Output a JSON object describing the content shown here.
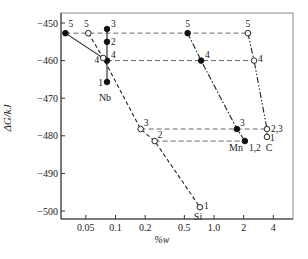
{
  "chart_data": {
    "type": "line",
    "title": "",
    "xlabel": "%w",
    "ylabel": "ΔG/kJ",
    "x_scale": "log",
    "xlim": [
      0.025,
      7.0
    ],
    "ylim": [
      -502,
      -447
    ],
    "x_ticks": [
      0.05,
      0.1,
      0.2,
      0.5,
      1.0,
      2,
      4
    ],
    "x_tick_labels": [
      "0.05",
      "0.1",
      "0.2",
      "0.5",
      "1.0",
      "2",
      "4"
    ],
    "y_ticks": [
      -450,
      -460,
      -470,
      -480,
      -490,
      -500
    ],
    "y_tick_labels": [
      "-450",
      "-460",
      "-470",
      "-480",
      "-490",
      "-500"
    ],
    "grid": false,
    "legend": "none (series labelled inline)",
    "series": [
      {
        "name": "Nb",
        "marker": "filled",
        "line_style": "solid",
        "points": [
          {
            "label": "5",
            "x": 0.031,
            "y": -452.7
          },
          {
            "label": "4",
            "x": 0.082,
            "y": -460.0
          },
          {
            "label": "3",
            "x": 0.082,
            "y": -451.6
          },
          {
            "label": "2",
            "x": 0.082,
            "y": -455.0
          },
          {
            "label": "1",
            "x": 0.082,
            "y": -465.7
          }
        ]
      },
      {
        "name": "Si",
        "marker": "open",
        "line_style": "dashed",
        "points": [
          {
            "label": "5",
            "x": 0.053,
            "y": -452.7
          },
          {
            "label": "4",
            "x": 0.075,
            "y": -459.3
          },
          {
            "label": "3",
            "x": 0.18,
            "y": -478.2
          },
          {
            "label": "2",
            "x": 0.25,
            "y": -481.4
          },
          {
            "label": "1",
            "x": 0.72,
            "y": -499.0
          }
        ]
      },
      {
        "name": "Mn",
        "marker": "filled",
        "line_style": "dash-dot",
        "points": [
          {
            "label": "5",
            "x": 0.54,
            "y": -452.7
          },
          {
            "label": "4",
            "x": 0.74,
            "y": -460.0
          },
          {
            "label": "3",
            "x": 1.71,
            "y": -478.2
          },
          {
            "label": "1,2",
            "x": 2.06,
            "y": -481.4
          }
        ]
      },
      {
        "name": "C",
        "marker": "open",
        "line_style": "dash-dot-dot",
        "points": [
          {
            "label": "5",
            "x": 2.21,
            "y": -452.7
          },
          {
            "label": "4",
            "x": 2.55,
            "y": -460.0
          },
          {
            "label": "2,3",
            "x": 3.45,
            "y": -478.2
          },
          {
            "label": "1",
            "x": 3.45,
            "y": -480.3
          }
        ]
      }
    ],
    "reference_lines": [
      {
        "y": -452.7,
        "style": "dashed",
        "from": "Nb 5",
        "to": "C 5"
      },
      {
        "y": -460.0,
        "style": "dashed",
        "from": "Nb 4",
        "to": "C 4"
      },
      {
        "y": -478.2,
        "style": "dashed",
        "from": "Si 3",
        "to": "C 2,3"
      },
      {
        "y": -481.4,
        "style": "dashed",
        "from": "Si 2",
        "to": "Mn 1,2"
      }
    ]
  },
  "labels": {
    "ylabel": "ΔG/kJ",
    "xlabel": "%w",
    "series_nb": "Nb",
    "series_si": "Si",
    "series_mn": "Mn",
    "series_c": "C"
  }
}
